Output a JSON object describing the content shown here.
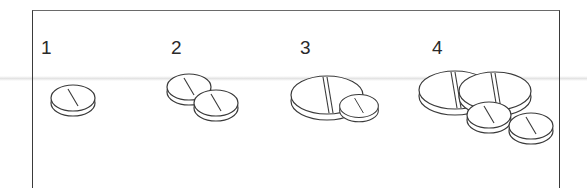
{
  "figure": {
    "groups": [
      {
        "label": "1",
        "pills": [
          "small"
        ]
      },
      {
        "label": "2",
        "pills": [
          "small",
          "small"
        ]
      },
      {
        "label": "3",
        "pills": [
          "large",
          "small"
        ]
      },
      {
        "label": "4",
        "pills": [
          "large",
          "large",
          "small",
          "small"
        ]
      }
    ]
  },
  "colors": {
    "line": "#3a3a3a",
    "fill": "#ffffff",
    "frame": "#3a3a3a"
  }
}
